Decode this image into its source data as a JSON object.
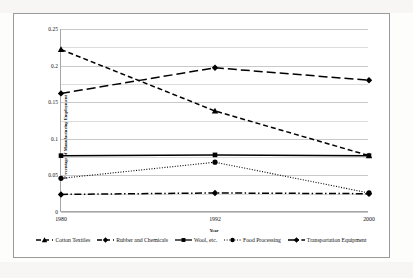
{
  "chart_data": {
    "type": "line",
    "title": "",
    "xlabel": "Year",
    "ylabel": "Percentage of Manufacturing Employment",
    "categories": [
      "1980",
      "1992",
      "2000"
    ],
    "x": [
      1980,
      1992,
      2000
    ],
    "ylim": [
      0,
      0.25
    ],
    "yticks": [
      "0",
      "0.05",
      "0.1",
      "0.15",
      "0.2",
      "0.25"
    ],
    "ytick_values": [
      0,
      0.05,
      0.1,
      0.15,
      0.2,
      0.25
    ],
    "minor_gridline_step": 0.025,
    "grid": true,
    "legend_position": "bottom",
    "series": [
      {
        "name": "Cotton Textiles",
        "values": [
          0.222,
          0.138,
          0.077
        ],
        "line_style": "dashed",
        "marker": "triangle",
        "color": "#000000"
      },
      {
        "name": "Rubber and Chemicals",
        "values": [
          0.162,
          0.197,
          0.18
        ],
        "line_style": "long-dashed",
        "marker": "diamond",
        "color": "#000000"
      },
      {
        "name": "Wool, etc.",
        "values": [
          0.077,
          0.078,
          0.077
        ],
        "line_style": "solid",
        "marker": "square",
        "color": "#000000"
      },
      {
        "name": "Food Processing",
        "values": [
          0.046,
          0.068,
          0.026
        ],
        "line_style": "dotted",
        "marker": "circle",
        "color": "#000000"
      },
      {
        "name": "Transportation Equipment",
        "values": [
          0.024,
          0.026,
          0.025
        ],
        "line_style": "dash-dot",
        "marker": "diamond",
        "color": "#000000"
      }
    ]
  }
}
